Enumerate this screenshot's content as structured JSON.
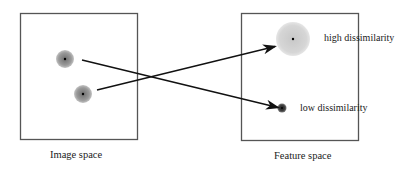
{
  "diagram": {
    "panels": [
      {
        "id": "image-space",
        "caption": "Image space",
        "box": {
          "x": 20,
          "y": 13,
          "w": 117,
          "h": 126
        },
        "points": [
          {
            "id": "point-a",
            "cx": 65,
            "cy": 59,
            "r": 9
          },
          {
            "id": "point-b",
            "cx": 83,
            "cy": 94,
            "r": 9
          }
        ]
      },
      {
        "id": "feature-space",
        "caption": "Feature space",
        "box": {
          "x": 241,
          "y": 13,
          "w": 117,
          "h": 127
        },
        "points": [
          {
            "id": "high-dissimilarity-point",
            "cx": 293,
            "cy": 39,
            "r": 17,
            "label": "high dissimilarity"
          },
          {
            "id": "low-dissimilarity-point",
            "cx": 282,
            "cy": 108,
            "r": 4,
            "label": "low dissimilarity"
          }
        ]
      }
    ],
    "arrows": [
      {
        "from": "point-a",
        "to": "low-dissimilarity-point",
        "x1": 82,
        "y1": 60,
        "x2": 277,
        "y2": 107
      },
      {
        "from": "point-b",
        "to": "high-dissimilarity-point",
        "x1": 97,
        "y1": 90,
        "x2": 273,
        "y2": 47
      }
    ],
    "labels": {
      "high": "high dissimilarity",
      "low": "low dissimilarity",
      "image_space": "Image space",
      "feature_space": "Feature space"
    },
    "colors": {
      "box_stroke": "#555555",
      "arrow": "#111111",
      "blob_dark": "#8a8a8a",
      "blob_light": "#cfcfcf",
      "blob_small": "#444444",
      "dot": "#000000"
    }
  }
}
